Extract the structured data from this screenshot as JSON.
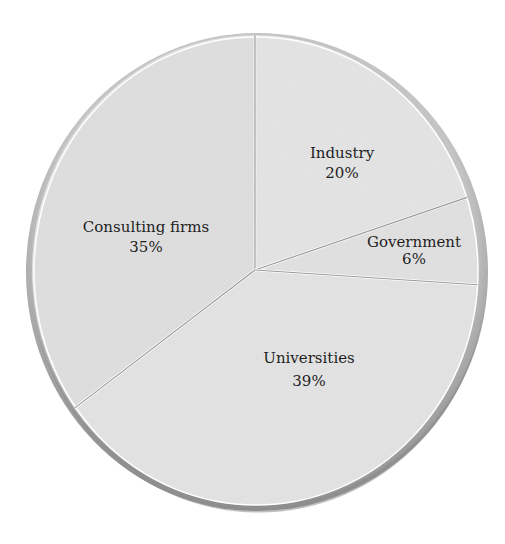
{
  "chart_data": {
    "type": "pie",
    "title": "",
    "categories": [
      "Industry",
      "Government",
      "Universities",
      "Consulting firms"
    ],
    "values": [
      20,
      6,
      39,
      35
    ],
    "value_labels": [
      "20%",
      "6%",
      "39%",
      "35%"
    ],
    "units": "%",
    "legend": "none (labels inside slices)",
    "start_angle_deg": 90,
    "direction": "clockwise",
    "colors": {
      "fill": "#e2e2e2",
      "rim": "#a8a8a8",
      "divider": "#9a9a9a",
      "highlight": "#ffffff",
      "text": "#1e1e1e"
    }
  },
  "slices": [
    {
      "name": "Industry",
      "pct": "20%"
    },
    {
      "name": "Government",
      "pct": "6%"
    },
    {
      "name": "Universities",
      "pct": "39%"
    },
    {
      "name": "Consulting firms",
      "pct": "35%"
    }
  ]
}
